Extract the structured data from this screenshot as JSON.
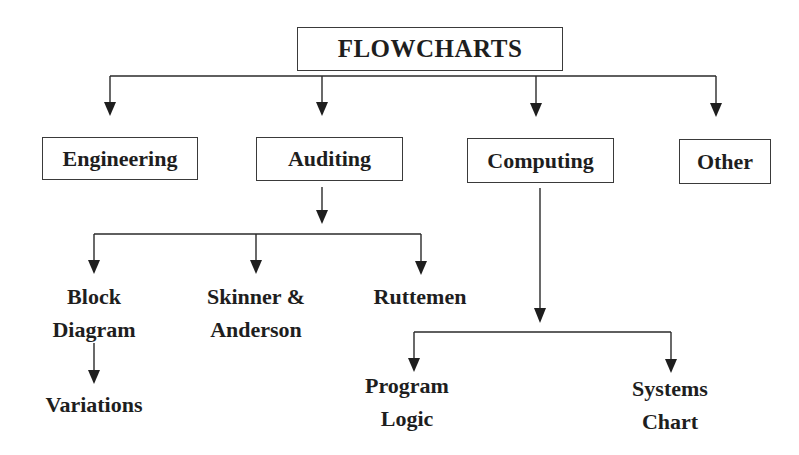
{
  "diagram": {
    "type": "hierarchy-flowchart",
    "root": {
      "id": "flowcharts",
      "label": "FLOWCHARTS"
    },
    "categories": [
      {
        "id": "engineering",
        "label": "Engineering"
      },
      {
        "id": "auditing",
        "label": "Auditing"
      },
      {
        "id": "computing",
        "label": "Computing"
      },
      {
        "id": "other",
        "label": "Other"
      }
    ],
    "auditing_children": [
      {
        "id": "block-diagram",
        "lines": [
          "Block",
          "Diagram"
        ]
      },
      {
        "id": "skinner-anderson",
        "lines": [
          "Skinner &",
          "Anderson"
        ]
      },
      {
        "id": "ruttemen",
        "lines": [
          "Ruttemen"
        ]
      }
    ],
    "block_diagram_children": [
      {
        "id": "variations",
        "lines": [
          "Variations"
        ]
      }
    ],
    "computing_children": [
      {
        "id": "program-logic",
        "lines": [
          "Program",
          "Logic"
        ]
      },
      {
        "id": "systems-chart",
        "lines": [
          "Systems",
          "Chart"
        ]
      }
    ],
    "edges": [
      [
        "FLOWCHARTS",
        "Engineering"
      ],
      [
        "FLOWCHARTS",
        "Auditing"
      ],
      [
        "FLOWCHARTS",
        "Computing"
      ],
      [
        "FLOWCHARTS",
        "Other"
      ],
      [
        "Auditing",
        "Block Diagram"
      ],
      [
        "Auditing",
        "Skinner & Anderson"
      ],
      [
        "Auditing",
        "Ruttemen"
      ],
      [
        "Block Diagram",
        "Variations"
      ],
      [
        "Computing",
        "Program Logic"
      ],
      [
        "Computing",
        "Systems Chart"
      ]
    ],
    "colors": {
      "background": "#ffffff",
      "ink": "#1e1e1e",
      "border": "#3a3a3a"
    }
  }
}
